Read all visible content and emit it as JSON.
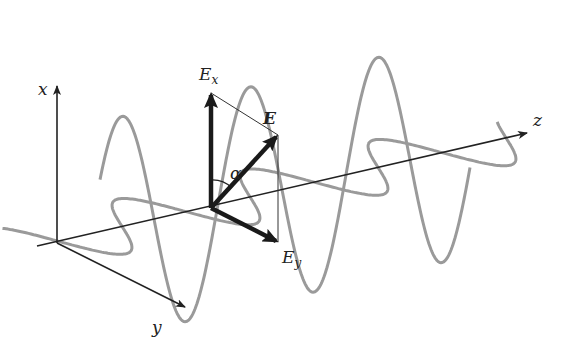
{
  "diagram": {
    "type": "electromagnetic-wave-polarization",
    "labels": {
      "x_axis": "x",
      "y_axis": "y",
      "z_axis": "z",
      "field_vector": "E",
      "ex_component": "E",
      "ex_sub": "x",
      "ey_component": "E",
      "ey_sub": "y",
      "angle": "α"
    },
    "colors": {
      "axis": "#222222",
      "wave": "#9a9a9a",
      "vector": "#1a1a1a",
      "construction": "#333333"
    },
    "geometry": {
      "origin": [
        57,
        243
      ],
      "x_axis_tip": [
        57,
        85
      ],
      "y_axis_tip": [
        185,
        307
      ],
      "z_axis_start": [
        37,
        246
      ],
      "z_axis_tip": [
        527,
        133
      ],
      "vector_origin": [
        211,
        208
      ],
      "ex_tip": [
        211,
        93
      ],
      "e_tip": [
        278,
        135
      ],
      "ey_tip": [
        278,
        242
      ]
    },
    "waves": {
      "x_wave": {
        "start_x": 100,
        "end_x": 470,
        "amplitude": 110,
        "period": 128,
        "phase_x0": 90
      },
      "y_wave": {
        "start_x": 35,
        "end_x": 520,
        "amplitude_dx": 36,
        "amplitude_dy": 20,
        "period": 128,
        "phase_x0": 58
      }
    }
  }
}
